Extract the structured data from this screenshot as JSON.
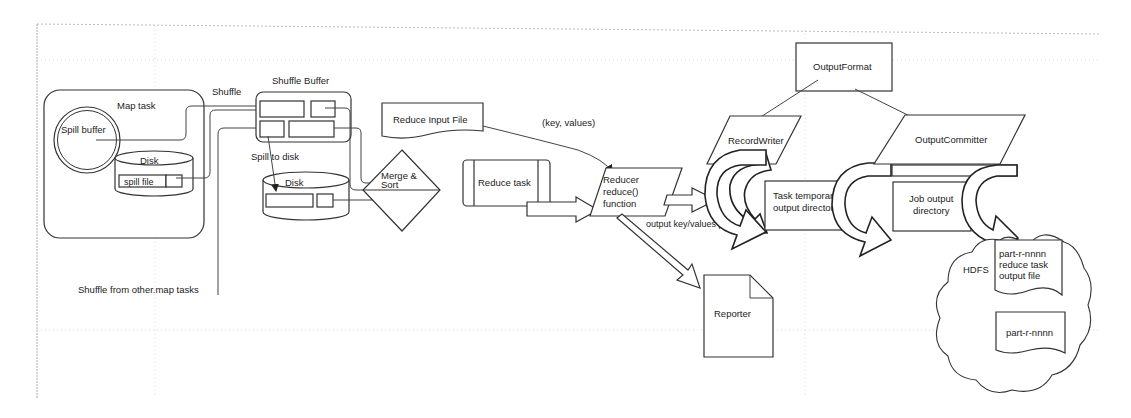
{
  "diagram": {
    "colors": {
      "background": "#ffffff",
      "stroke": "#2a2a2a",
      "grid": "#d8d8d8",
      "text": "#222222"
    },
    "map_side": {
      "map_task_label": "Map task",
      "spill_buffer_label": "Spill buffer",
      "disk_label": "Disk",
      "spill_file_label": "spill file",
      "shuffle_label": "Shuffle",
      "shuffle_other_label": "Shuffle from other.map tasks"
    },
    "shuffle_side": {
      "shuffle_buffer_label": "Shuffle Buffer",
      "spill_to_disk_label": "Spill to disk",
      "disk_label": "Disk",
      "merge_sort_line1": "Merge &",
      "merge_sort_line2": "Sort"
    },
    "reduce_side": {
      "reduce_input_file_label": "Reduce Input File",
      "key_values_label": "(key, values)",
      "reduce_task_label": "Reduce task",
      "reducer_line1": "Reducer",
      "reducer_line2": "reduce()",
      "reducer_line3": "function",
      "output_pair_label": "output key/values pair",
      "reporter_label": "Reporter"
    },
    "output_side": {
      "output_format_label": "OutputFormat",
      "record_writer_label": "RecordWriter",
      "output_committer_label": "OutputCommitter",
      "task_temp_line1": "Task temporary",
      "task_temp_line2": "output directory",
      "job_output_line1": "Job output",
      "job_output_line2": "directory",
      "hdfs_label": "HDFS",
      "part_file_line1": "part-r-nnnn",
      "part_file_line2": "reduce task",
      "part_file_line3": "output file",
      "part_file2_label": "part-r-nnnn"
    }
  }
}
